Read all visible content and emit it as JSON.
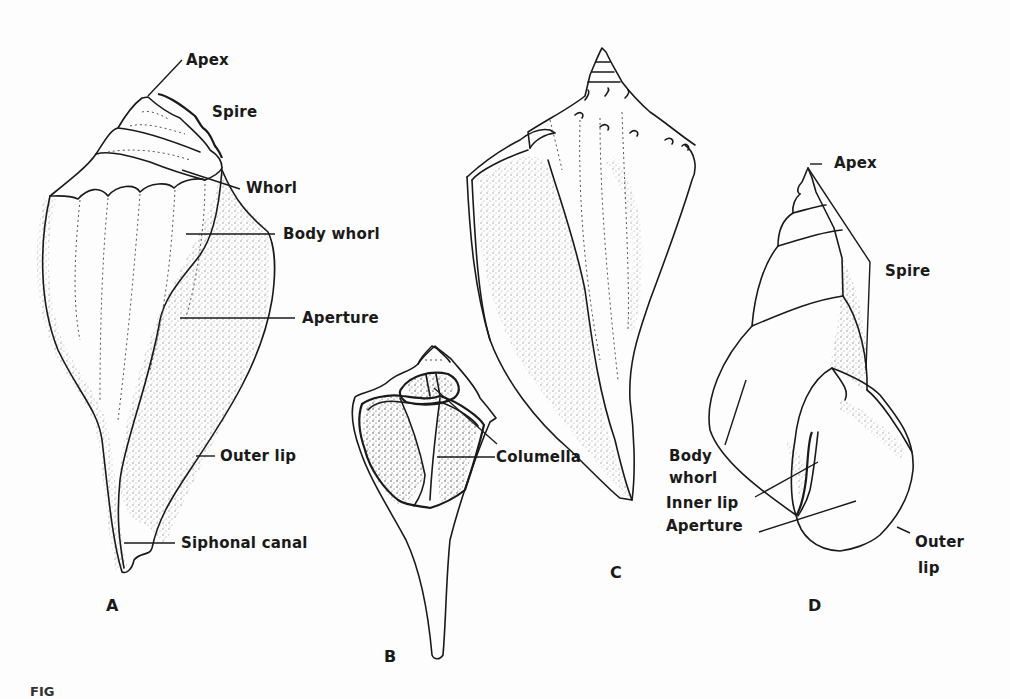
{
  "figure": {
    "caption_partial": "FIG",
    "panels": [
      {
        "id": "A",
        "label": "A",
        "labels": {
          "apex": "Apex",
          "spire": "Spire",
          "whorl": "Whorl",
          "body_whorl": "Body whorl",
          "aperture": "Aperture",
          "outer_lip": "Outer lip",
          "siphonal_canal": "Siphonal canal"
        }
      },
      {
        "id": "B",
        "label": "B",
        "labels": {
          "columella": "Columella"
        }
      },
      {
        "id": "C",
        "label": "C",
        "labels": {}
      },
      {
        "id": "D",
        "label": "D",
        "labels": {
          "apex": "Apex",
          "spire": "Spire",
          "body_whorl_line1": "Body",
          "body_whorl_line2": "whorl",
          "inner_lip": "Inner lip",
          "aperture": "Aperture",
          "outer_lip_line1": "Outer",
          "outer_lip_line2": "lip"
        }
      }
    ]
  },
  "colors": {
    "ink": "#1a1a1a",
    "paper": "#fdfdfd"
  }
}
